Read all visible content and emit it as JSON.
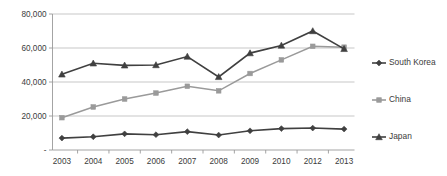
{
  "chart_data": {
    "type": "line",
    "title": "",
    "xlabel": "",
    "ylabel": "",
    "categories": [
      "2003",
      "2004",
      "2005",
      "2006",
      "2007",
      "2008",
      "2009",
      "2010",
      "2012",
      "2013"
    ],
    "ylim": [
      0,
      80000
    ],
    "yticks": [
      0,
      20000,
      40000,
      60000,
      80000
    ],
    "ytick_labels": [
      "-",
      "20,000",
      "40,000",
      "60,000",
      "80,000"
    ],
    "grid": true,
    "legend_position": "right",
    "series": [
      {
        "name": "South Korea",
        "color": "#404040",
        "marker": "diamond",
        "values": [
          7000,
          7800,
          9500,
          9000,
          10800,
          8800,
          11300,
          12600,
          12900,
          12300
        ]
      },
      {
        "name": "China",
        "color": "#9a9a9a",
        "marker": "square",
        "values": [
          19000,
          25300,
          30000,
          33500,
          37500,
          34800,
          45000,
          53000,
          61000,
          60500
        ]
      },
      {
        "name": "Japan",
        "color": "#404040",
        "marker": "triangle",
        "values": [
          44500,
          51000,
          49800,
          50000,
          55000,
          43000,
          57000,
          61500,
          70000,
          59500
        ]
      }
    ]
  },
  "legend": {
    "items": [
      {
        "label": "South Korea"
      },
      {
        "label": "China"
      },
      {
        "label": "Japan"
      }
    ]
  },
  "colors": {
    "dark_series": "#404040",
    "gray_series": "#9a9a9a",
    "gridline": "#b9b9b9",
    "axis": "#9a9a9a",
    "text": "#3b3b3b",
    "background": "#ffffff"
  }
}
